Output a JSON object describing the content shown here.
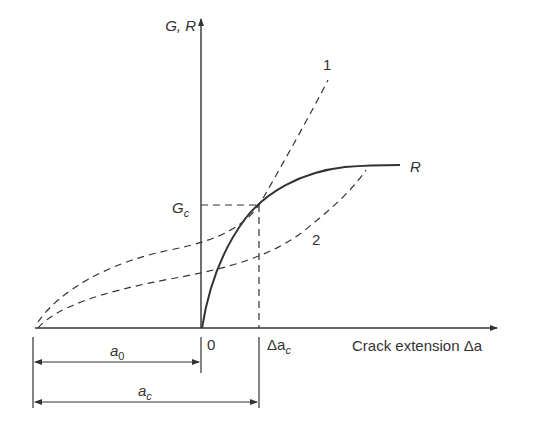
{
  "diagram": {
    "title": "",
    "y_axis_label": "G, R",
    "x_axis_label": "Crack extension Δa",
    "origin_label": "0",
    "critical_g_label": {
      "main": "G",
      "sub": "c"
    },
    "critical_extension_label": {
      "main": "Δa",
      "sub": "c"
    },
    "initial_crack_label": {
      "main": "a",
      "sub": "0"
    },
    "critical_crack_label": {
      "main": "a",
      "sub": "c"
    },
    "curves": [
      {
        "id": "R",
        "label": "R",
        "style": "solid",
        "description": "Crack growth resistance curve"
      },
      {
        "id": "1",
        "label": "1",
        "style": "dashed",
        "description": "Driving force curve 1 (tangent to R at Gc)"
      },
      {
        "id": "2",
        "label": "2",
        "style": "dashed",
        "description": "Driving force curve 2"
      }
    ],
    "colors": {
      "line": "#333333",
      "background": "#ffffff"
    }
  }
}
